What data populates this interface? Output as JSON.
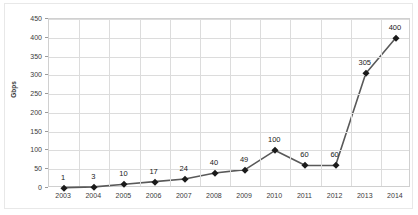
{
  "chart_data": {
    "type": "line",
    "title": "",
    "xlabel": "",
    "ylabel": "Gbps",
    "categories": [
      "2003",
      "2004",
      "2005",
      "2006",
      "2007",
      "2008",
      "2009",
      "2010",
      "2011",
      "2012",
      "2013",
      "2014"
    ],
    "values": [
      1,
      3,
      10,
      17,
      24,
      40,
      49,
      100,
      60,
      60,
      305,
      400
    ],
    "point_labels": [
      "1",
      "3",
      "10",
      "17",
      "24",
      "40",
      "49",
      "100",
      "60",
      "60",
      "305",
      "400"
    ],
    "ylim": [
      0,
      450
    ],
    "y_ticks": [
      0,
      50,
      100,
      150,
      200,
      250,
      300,
      350,
      400,
      450
    ],
    "y_tick_labels": [
      "0",
      "50",
      "100",
      "150",
      "200",
      "250",
      "300",
      "350",
      "400",
      "450"
    ],
    "grid": true,
    "legend": "none",
    "series": [
      {
        "name": "Gbps",
        "values": [
          1,
          3,
          10,
          17,
          24,
          40,
          49,
          100,
          60,
          60,
          305,
          400
        ]
      }
    ],
    "colors": {
      "line": "#595959",
      "marker": "#1a1a1a",
      "grid": "#dcdcdc",
      "axis": "#d0d0d0",
      "text": "#3a3a3a",
      "background": "#ffffff"
    },
    "marker_style": "diamond"
  }
}
